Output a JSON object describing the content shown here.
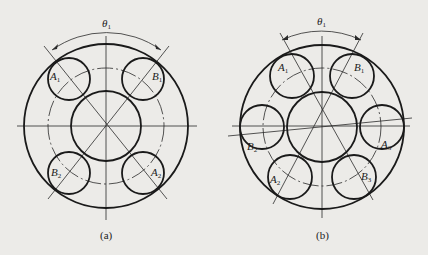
{
  "figure_a": {
    "caption": "(a)",
    "angle_label": "θ",
    "angle_sub": "1",
    "balls": [
      {
        "letter": "A",
        "sub": "1",
        "position": "top-left"
      },
      {
        "letter": "B",
        "sub": "1",
        "position": "top-right"
      },
      {
        "letter": "B",
        "sub": "2",
        "position": "bottom-left"
      },
      {
        "letter": "A",
        "sub": "2",
        "position": "bottom-right"
      }
    ]
  },
  "figure_b": {
    "caption": "(b)",
    "angle_label": "θ",
    "angle_sub": "1",
    "balls": [
      {
        "letter": "A",
        "sub": "1",
        "position": "top-left"
      },
      {
        "letter": "B",
        "sub": "1",
        "position": "top-right"
      },
      {
        "letter": "B",
        "sub": "2",
        "position": "left"
      },
      {
        "letter": "A",
        "sub": "3",
        "position": "right"
      },
      {
        "letter": "A",
        "sub": "2",
        "position": "bottom-left"
      },
      {
        "letter": "B",
        "sub": "3",
        "position": "bottom-right"
      }
    ]
  }
}
